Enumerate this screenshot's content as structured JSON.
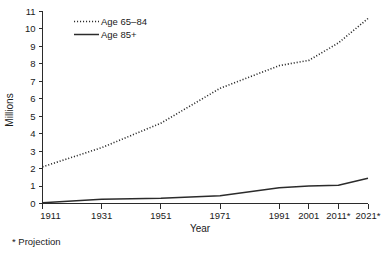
{
  "footnote": "* Projection",
  "legend": {
    "position": "top-left-inside",
    "entries": [
      {
        "label": "Age 65–84",
        "style": "dotted"
      },
      {
        "label": "Age 85+",
        "style": "solid"
      }
    ]
  },
  "axes": {
    "y_title": "Millions",
    "x_title": "Year",
    "y_ticks": [
      "0",
      "1",
      "2",
      "3",
      "4",
      "5",
      "6",
      "7",
      "8",
      "9",
      "10",
      "11"
    ],
    "x_ticks": [
      "1911",
      "1931",
      "1951",
      "1971",
      "1991",
      "2001",
      "2011*",
      "2021*"
    ]
  },
  "colors": {
    "ink": "#2b2b2b",
    "text": "#1a1a1a",
    "background": "#ffffff"
  },
  "chart_data": {
    "type": "line",
    "title": "",
    "subtitle": "",
    "xlabel": "Year",
    "ylabel": "Millions",
    "annotations": [
      "* Projection"
    ],
    "grid": false,
    "legend_position": "top-left-inside",
    "categories": [
      "1911",
      "1931",
      "1951",
      "1971",
      "1991",
      "2001",
      "2011*",
      "2021*"
    ],
    "x": [
      1911,
      1931,
      1951,
      1971,
      1991,
      2001,
      2011,
      2021
    ],
    "xlim": [
      1911,
      2021
    ],
    "ylim": [
      0,
      11
    ],
    "ytick_step": 1,
    "series": [
      {
        "name": "Age 65–84",
        "style": "dotted",
        "values": [
          2.1,
          3.2,
          4.6,
          6.6,
          7.9,
          8.2,
          9.2,
          10.6
        ]
      },
      {
        "name": "Age 85+",
        "style": "solid",
        "values": [
          0.05,
          0.25,
          0.3,
          0.45,
          0.9,
          1.0,
          1.05,
          1.45
        ]
      }
    ]
  }
}
